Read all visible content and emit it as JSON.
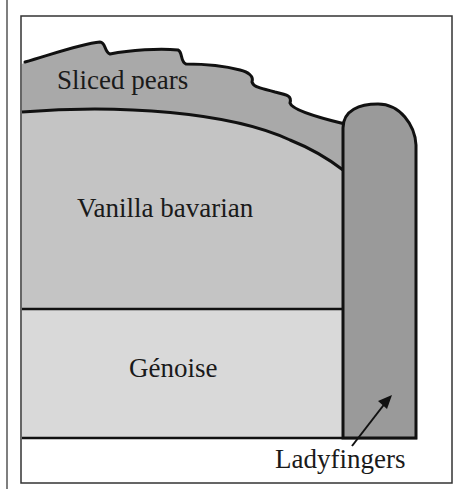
{
  "diagram": {
    "layers": [
      {
        "id": "sliced-pears",
        "label": "Sliced pears",
        "color": "#a9a9a9"
      },
      {
        "id": "vanilla-bavarian",
        "label": "Vanilla bavarian",
        "color": "#c4c4c4"
      },
      {
        "id": "genoise",
        "label": "Génoise",
        "color": "#d9d9d9"
      },
      {
        "id": "ladyfingers",
        "label": "Ladyfingers",
        "color": "#9a9a9a"
      }
    ],
    "colors": {
      "outline": "#111111",
      "frame": "#333333",
      "background": "#ffffff"
    }
  }
}
